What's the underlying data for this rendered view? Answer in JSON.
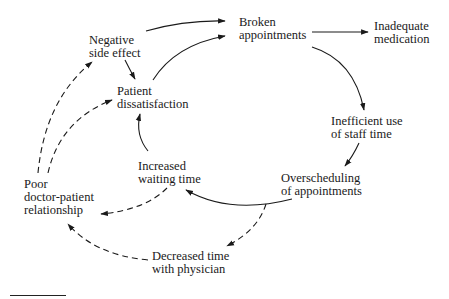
{
  "diagram": {
    "type": "causal-loop",
    "nodes": [
      {
        "id": "negative_side_effect",
        "lines": [
          "Negative",
          "side effect"
        ]
      },
      {
        "id": "broken_appointments",
        "lines": [
          "Broken",
          "appointments"
        ]
      },
      {
        "id": "inadequate_medication",
        "lines": [
          "Inadequate",
          "medication"
        ]
      },
      {
        "id": "patient_dissatisfaction",
        "lines": [
          "Patient",
          "dissatisfaction"
        ]
      },
      {
        "id": "inefficient_use",
        "lines": [
          "Inefficient use",
          "of staff time"
        ]
      },
      {
        "id": "increased_waiting",
        "lines": [
          "Increased",
          "waiting time"
        ]
      },
      {
        "id": "overscheduling",
        "lines": [
          "Overscheduling",
          "of appointments"
        ]
      },
      {
        "id": "poor_relationship",
        "lines": [
          "Poor",
          "doctor-patient",
          "relationship"
        ]
      },
      {
        "id": "decreased_time",
        "lines": [
          "Decreased time",
          "with physician"
        ]
      }
    ],
    "edges": [
      {
        "from": "negative_side_effect",
        "to": "broken_appointments",
        "style": "solid"
      },
      {
        "from": "patient_dissatisfaction",
        "to": "broken_appointments",
        "style": "solid"
      },
      {
        "from": "negative_side_effect",
        "to": "patient_dissatisfaction",
        "style": "solid"
      },
      {
        "from": "broken_appointments",
        "to": "inadequate_medication",
        "style": "solid"
      },
      {
        "from": "broken_appointments",
        "to": "inefficient_use",
        "style": "solid"
      },
      {
        "from": "inefficient_use",
        "to": "overscheduling",
        "style": "solid"
      },
      {
        "from": "overscheduling",
        "to": "increased_waiting",
        "style": "solid"
      },
      {
        "from": "increased_waiting",
        "to": "patient_dissatisfaction",
        "style": "solid"
      },
      {
        "from": "overscheduling",
        "to": "decreased_time",
        "style": "dashed"
      },
      {
        "from": "increased_waiting",
        "to": "poor_relationship",
        "style": "dashed"
      },
      {
        "from": "decreased_time",
        "to": "poor_relationship",
        "style": "dashed"
      },
      {
        "from": "poor_relationship",
        "to": "negative_side_effect",
        "style": "dashed"
      },
      {
        "from": "poor_relationship",
        "to": "patient_dissatisfaction",
        "style": "dashed"
      }
    ]
  }
}
